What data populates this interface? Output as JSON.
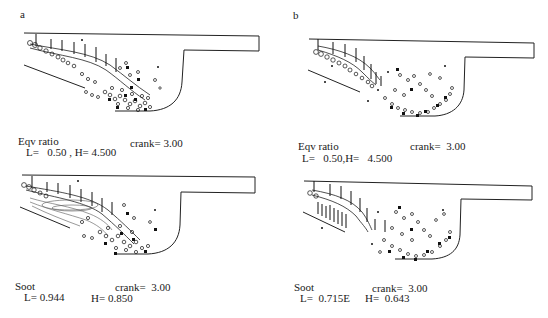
{
  "figure": {
    "panels": [
      {
        "id": "a",
        "letter": "a",
        "quantity": "Eqv ratio",
        "range": "L=   0.50 , H= 4.500",
        "crank": "crank= 3.00"
      },
      {
        "id": "b",
        "letter": "b",
        "quantity": "Eqv ratio",
        "range": "L=   0.50,H=   4.500",
        "crank": "crank=  3.00"
      },
      {
        "id": "c",
        "letter": "",
        "quantity": "Soot",
        "range_low": "L= 0.944",
        "range_high": "H= 0.850",
        "crank": "crank=  3.00"
      },
      {
        "id": "d",
        "letter": "",
        "quantity": "Soot",
        "range_low": "L=  0.715E",
        "range_high": "H=  0.643",
        "crank": "crank=  3.00"
      }
    ],
    "colors": {
      "background": "#ffffff",
      "ink": "#1a1a1a"
    }
  }
}
